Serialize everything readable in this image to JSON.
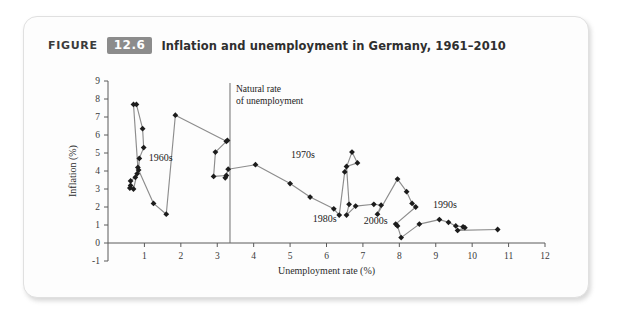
{
  "figure": {
    "label": "FIGURE",
    "number": "12.6",
    "caption": "Inflation and unemployment in Germany, 1961–2010"
  },
  "chart_data": {
    "type": "scatter",
    "title": "Inflation and unemployment in Germany, 1961–2010",
    "xlabel": "Unemployment rate (%)",
    "ylabel": "Inflation (%)",
    "xlim": [
      0,
      12
    ],
    "ylim": [
      -1,
      9
    ],
    "xticks": [
      1,
      2,
      3,
      4,
      5,
      6,
      7,
      8,
      9,
      10,
      11,
      12
    ],
    "yticks": [
      -1,
      0,
      1,
      2,
      3,
      4,
      5,
      6,
      7,
      8,
      9
    ],
    "grid": false,
    "legend": "none",
    "connected": true,
    "marker": "diamond",
    "annotations": [
      {
        "text": "Natural rate of unemployment",
        "x": 3.35,
        "y": 8.4,
        "kind": "vertical-line-label"
      },
      {
        "text": "1960s",
        "x": 1.45,
        "y": 4.55,
        "kind": "decade-label"
      },
      {
        "text": "1970s",
        "x": 5.35,
        "y": 4.75,
        "kind": "decade-label"
      },
      {
        "text": "1980s",
        "x": 5.95,
        "y": 1.15,
        "kind": "decade-label"
      },
      {
        "text": "2000s",
        "x": 7.35,
        "y": 1.05,
        "kind": "decade-label"
      },
      {
        "text": "1990s",
        "x": 9.25,
        "y": 1.95,
        "kind": "decade-label"
      }
    ],
    "reference_lines": [
      {
        "orientation": "vertical",
        "x": 3.35,
        "label": "Natural rate of unemployment"
      }
    ],
    "series": [
      {
        "name": "Germany inflation vs unemployment 1961-2010",
        "points": [
          {
            "x": 0.75,
            "y": 3.65
          },
          {
            "x": 0.62,
            "y": 3.45
          },
          {
            "x": 0.62,
            "y": 3.2
          },
          {
            "x": 0.6,
            "y": 3.05
          },
          {
            "x": 0.7,
            "y": 3.0
          },
          {
            "x": 0.8,
            "y": 3.85
          },
          {
            "x": 0.82,
            "y": 4.2
          },
          {
            "x": 0.7,
            "y": 7.7
          },
          {
            "x": 0.78,
            "y": 7.7
          },
          {
            "x": 0.95,
            "y": 6.35
          },
          {
            "x": 0.98,
            "y": 5.3
          },
          {
            "x": 0.86,
            "y": 4.7
          },
          {
            "x": 0.84,
            "y": 4.05
          },
          {
            "x": 1.25,
            "y": 2.2
          },
          {
            "x": 1.6,
            "y": 1.6
          },
          {
            "x": 1.85,
            "y": 7.1
          },
          {
            "x": 3.25,
            "y": 5.65
          },
          {
            "x": 3.28,
            "y": 5.7
          },
          {
            "x": 2.95,
            "y": 5.05
          },
          {
            "x": 2.9,
            "y": 3.7
          },
          {
            "x": 3.25,
            "y": 3.75
          },
          {
            "x": 3.22,
            "y": 3.62
          },
          {
            "x": 3.3,
            "y": 4.1
          },
          {
            "x": 4.05,
            "y": 4.35
          },
          {
            "x": 5.0,
            "y": 3.3
          },
          {
            "x": 5.55,
            "y": 2.55
          },
          {
            "x": 6.2,
            "y": 1.9
          },
          {
            "x": 6.35,
            "y": 1.55
          },
          {
            "x": 6.5,
            "y": 3.95
          },
          {
            "x": 6.7,
            "y": 5.05
          },
          {
            "x": 6.85,
            "y": 4.45
          },
          {
            "x": 6.55,
            "y": 4.25
          },
          {
            "x": 6.62,
            "y": 2.15
          },
          {
            "x": 6.55,
            "y": 1.55
          },
          {
            "x": 6.8,
            "y": 2.05
          },
          {
            "x": 7.3,
            "y": 2.15
          },
          {
            "x": 7.5,
            "y": 2.1
          },
          {
            "x": 7.4,
            "y": 1.6
          },
          {
            "x": 7.95,
            "y": 3.55
          },
          {
            "x": 8.2,
            "y": 2.85
          },
          {
            "x": 8.35,
            "y": 2.2
          },
          {
            "x": 8.45,
            "y": 2.0
          },
          {
            "x": 7.9,
            "y": 1.05
          },
          {
            "x": 7.95,
            "y": 0.95
          },
          {
            "x": 8.05,
            "y": 0.3
          },
          {
            "x": 8.55,
            "y": 1.05
          },
          {
            "x": 9.1,
            "y": 1.3
          },
          {
            "x": 9.35,
            "y": 1.15
          },
          {
            "x": 9.55,
            "y": 0.95
          },
          {
            "x": 9.75,
            "y": 0.9
          },
          {
            "x": 9.8,
            "y": 0.85
          },
          {
            "x": 9.6,
            "y": 0.7
          },
          {
            "x": 10.7,
            "y": 0.75
          }
        ]
      }
    ]
  }
}
